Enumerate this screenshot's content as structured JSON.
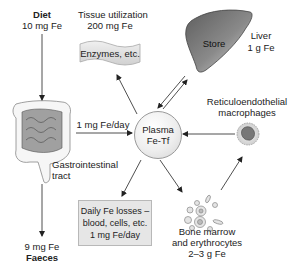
{
  "diagram": {
    "center": {
      "line1": "Plasma",
      "line2": "Fe-Tf"
    },
    "diet": {
      "label": "Diet",
      "amount": "10 mg Fe"
    },
    "tissue": {
      "line1": "Tissue utilization",
      "line2": "200 mg Fe",
      "box": "Enzymes, etc."
    },
    "liver": {
      "shape_label": "Store",
      "line1": "Liver",
      "line2": "1 g Fe"
    },
    "gi": {
      "absorption": "1 mg Fe/day",
      "line1": "Gastrointestinal",
      "line2": "tract"
    },
    "macrophages": {
      "line1": "Reticuloendothelial",
      "line2": "macrophages"
    },
    "losses": {
      "line1": "Daily Fe losses –",
      "line2": "blood, cells, etc.",
      "line3": "1 mg Fe/day"
    },
    "bone_marrow": {
      "line1": "Bone marrow",
      "line2": "and erythrocytes",
      "line3": "2–3 g Fe"
    },
    "faeces": {
      "amount": "9 mg Fe",
      "label": "Faeces"
    },
    "colors": {
      "line": "#333333",
      "liver_dark": "#6e6e6e",
      "liver_light": "#d0d0d0",
      "box_fill": "#e6e6e6",
      "background": "#ffffff"
    },
    "icons": [
      "intestine-illustration",
      "liver-illustration",
      "macrophage-illustration",
      "blood-cells-illustration",
      "wavy-banner"
    ]
  }
}
